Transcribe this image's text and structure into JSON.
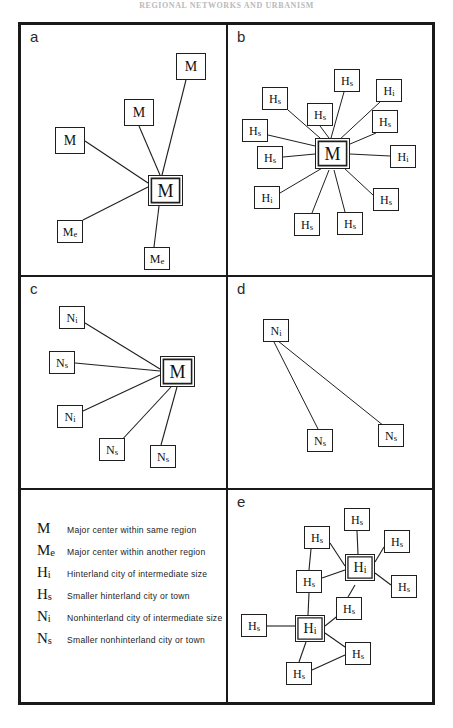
{
  "page": {
    "running_head": "REGIONAL NETWORKS AND URBANISM",
    "background_color": "#ffffff",
    "ink_color": "#1a1a1a"
  },
  "legend": {
    "name": "symbol-legend",
    "entries": [
      {
        "key_main": "M",
        "key_sub": "",
        "description": "Major center within same region"
      },
      {
        "key_main": "M",
        "key_sub": "e",
        "description": "Major center within another region"
      },
      {
        "key_main": "H",
        "key_sub": "i",
        "description": "Hinterland city of intermediate size"
      },
      {
        "key_main": "H",
        "key_sub": "s",
        "description": "Smaller hinterland city or town"
      },
      {
        "key_main": "N",
        "key_sub": "i",
        "description": "Nonhinterland city of intermediate size"
      },
      {
        "key_main": "N",
        "key_sub": "s",
        "description": "Smaller nonhinterland city or town"
      }
    ]
  },
  "panels": [
    {
      "id": "a",
      "letter": "a",
      "width": 205,
      "height": 250,
      "hub": {
        "main": "M",
        "sub": "",
        "x": 127,
        "y": 150,
        "size": "hub"
      },
      "nodes": [
        {
          "main": "M",
          "sub": "",
          "x": 155,
          "y": 28,
          "size": "md"
        },
        {
          "main": "M",
          "sub": "",
          "x": 103,
          "y": 74,
          "size": "md"
        },
        {
          "main": "M",
          "sub": "",
          "x": 34,
          "y": 102,
          "size": "md"
        },
        {
          "main": "M",
          "sub": "e",
          "x": 36,
          "y": 195,
          "size": "sm"
        },
        {
          "main": "M",
          "sub": "e",
          "x": 123,
          "y": 222,
          "size": "sm"
        }
      ]
    },
    {
      "id": "b",
      "letter": "b",
      "width": 208,
      "height": 250,
      "hub": {
        "main": "M",
        "sub": "",
        "x": 87,
        "y": 113,
        "size": "hub"
      },
      "nodes": [
        {
          "main": "H",
          "sub": "s",
          "x": 106,
          "y": 44,
          "size": "sm"
        },
        {
          "main": "H",
          "sub": "i",
          "x": 148,
          "y": 54,
          "size": "sm"
        },
        {
          "main": "H",
          "sub": "s",
          "x": 34,
          "y": 62,
          "size": "sm"
        },
        {
          "main": "H",
          "sub": "s",
          "x": 79,
          "y": 78,
          "size": "sm"
        },
        {
          "main": "H",
          "sub": "s",
          "x": 144,
          "y": 85,
          "size": "sm"
        },
        {
          "main": "H",
          "sub": "s",
          "x": 14,
          "y": 94,
          "size": "sm"
        },
        {
          "main": "H",
          "sub": "s",
          "x": 29,
          "y": 121,
          "size": "sm"
        },
        {
          "main": "H",
          "sub": "i",
          "x": 162,
          "y": 120,
          "size": "sm"
        },
        {
          "main": "H",
          "sub": "i",
          "x": 26,
          "y": 161,
          "size": "sm"
        },
        {
          "main": "H",
          "sub": "s",
          "x": 145,
          "y": 163,
          "size": "sm"
        },
        {
          "main": "H",
          "sub": "s",
          "x": 66,
          "y": 188,
          "size": "sm"
        },
        {
          "main": "H",
          "sub": "s",
          "x": 109,
          "y": 187,
          "size": "sm"
        }
      ]
    },
    {
      "id": "c",
      "letter": "c",
      "width": 205,
      "height": 213,
      "hub": {
        "main": "M",
        "sub": "",
        "x": 139,
        "y": 79,
        "size": "hub"
      },
      "nodes": [
        {
          "main": "N",
          "sub": "i",
          "x": 38,
          "y": 29,
          "size": "sm"
        },
        {
          "main": "N",
          "sub": "s",
          "x": 28,
          "y": 74,
          "size": "sm"
        },
        {
          "main": "N",
          "sub": "i",
          "x": 36,
          "y": 128,
          "size": "sm"
        },
        {
          "main": "N",
          "sub": "s",
          "x": 78,
          "y": 161,
          "size": "sm"
        },
        {
          "main": "N",
          "sub": "s",
          "x": 129,
          "y": 168,
          "size": "sm"
        }
      ]
    },
    {
      "id": "d",
      "letter": "d",
      "width": 208,
      "height": 213,
      "hub": {
        "main": "N",
        "sub": "i",
        "x": 35,
        "y": 42,
        "size": "sm"
      },
      "nodes": [
        {
          "main": "N",
          "sub": "s",
          "x": 79,
          "y": 152,
          "size": "sm"
        },
        {
          "main": "N",
          "sub": "s",
          "x": 150,
          "y": 147,
          "size": "sm"
        }
      ]
    },
    {
      "id": "e",
      "letter": "e",
      "width": 208,
      "height": 212,
      "nodes": [
        {
          "main": "H",
          "sub": "i",
          "x": 117,
          "y": 64,
          "size": "hub2",
          "key": "hi-top"
        },
        {
          "main": "H",
          "sub": "i",
          "x": 67,
          "y": 125,
          "size": "hub2",
          "key": "hi-bottom"
        },
        {
          "main": "H",
          "sub": "s",
          "x": 116,
          "y": 18,
          "size": "sm",
          "key": "hs-n"
        },
        {
          "main": "H",
          "sub": "s",
          "x": 76,
          "y": 36,
          "size": "sm",
          "key": "hs-nw"
        },
        {
          "main": "H",
          "sub": "s",
          "x": 156,
          "y": 40,
          "size": "sm",
          "key": "hs-ne"
        },
        {
          "main": "H",
          "sub": "s",
          "x": 68,
          "y": 80,
          "size": "sm",
          "key": "hs-w"
        },
        {
          "main": "H",
          "sub": "s",
          "x": 163,
          "y": 85,
          "size": "sm",
          "key": "hs-e"
        },
        {
          "main": "H",
          "sub": "s",
          "x": 108,
          "y": 107,
          "size": "sm",
          "key": "hs-mid"
        },
        {
          "main": "H",
          "sub": "s",
          "x": 13,
          "y": 124,
          "size": "sm",
          "key": "hs-far-w"
        },
        {
          "main": "H",
          "sub": "s",
          "x": 117,
          "y": 152,
          "size": "sm",
          "key": "hs-se"
        },
        {
          "main": "H",
          "sub": "s",
          "x": 58,
          "y": 172,
          "size": "sm",
          "key": "hs-s"
        }
      ]
    }
  ],
  "panel_letters": {
    "a": "a",
    "b": "b",
    "c": "c",
    "d": "d",
    "e": "e"
  }
}
